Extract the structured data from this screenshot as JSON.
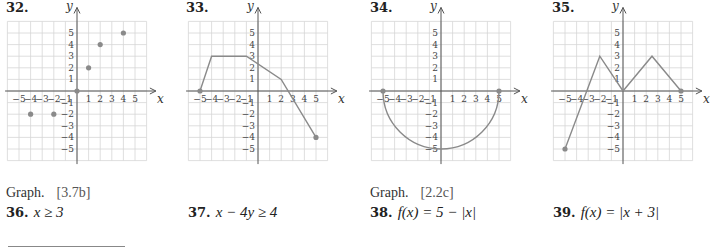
{
  "graphs": [
    {
      "number": "32.",
      "ox": 77,
      "type": "scatter",
      "points": [
        [
          -4,
          -2
        ],
        [
          -2,
          -2
        ],
        [
          0,
          0
        ],
        [
          1,
          2
        ],
        [
          2,
          4
        ],
        [
          4,
          5
        ]
      ]
    },
    {
      "number": "33.",
      "ox": 258,
      "type": "line",
      "points": [
        [
          -5,
          0
        ],
        [
          -4,
          3
        ],
        [
          -1,
          3
        ],
        [
          2,
          1
        ],
        [
          5,
          -4
        ]
      ],
      "endpoints": [
        [
          -5,
          0
        ],
        [
          5,
          -4
        ]
      ]
    },
    {
      "number": "34.",
      "ox": 441,
      "type": "semicircle",
      "radius": 5,
      "endpoints": [
        [
          -5,
          0
        ],
        [
          5,
          0
        ]
      ]
    },
    {
      "number": "35.",
      "ox": 623,
      "type": "line",
      "points": [
        [
          -5,
          -5
        ],
        [
          -2,
          3
        ],
        [
          0,
          0
        ],
        [
          2.5,
          3
        ],
        [
          5,
          0
        ]
      ],
      "endpoints": [
        [
          -5,
          -5
        ],
        [
          5,
          0
        ]
      ]
    }
  ],
  "axis": {
    "x_label": "x",
    "y_label": "y",
    "ticks": [
      -5,
      -4,
      -3,
      -2,
      -1,
      1,
      2,
      3,
      4,
      5
    ]
  },
  "sections": [
    {
      "instruction": "Graph.",
      "ref": "[3.7b]",
      "problems": [
        {
          "num": "36.",
          "expr": "x ≥ 3"
        },
        {
          "num": "37.",
          "expr": "x − 4y ≥ 4"
        }
      ]
    },
    {
      "instruction": "Graph.",
      "ref": "[2.2c]",
      "problems": [
        {
          "num": "38.",
          "expr": "f(x) = 5 − |x|"
        },
        {
          "num": "39.",
          "expr": "f(x) = |x + 3|"
        }
      ]
    }
  ],
  "chart_data": [
    {
      "type": "scatter",
      "title": "32.",
      "x": [
        -4,
        -2,
        0,
        1,
        2,
        4
      ],
      "y": [
        -2,
        -2,
        0,
        2,
        4,
        5
      ],
      "xlabel": "x",
      "ylabel": "y",
      "xlim": [
        -6,
        6
      ],
      "ylim": [
        -6,
        6
      ],
      "grid": true
    },
    {
      "type": "line",
      "title": "33.",
      "x": [
        -5,
        -4,
        -1,
        2,
        5
      ],
      "y": [
        0,
        3,
        3,
        1,
        -4
      ],
      "xlabel": "x",
      "ylabel": "y",
      "xlim": [
        -6,
        6
      ],
      "ylim": [
        -6,
        6
      ],
      "grid": true
    },
    {
      "type": "line",
      "title": "34.",
      "description": "lower semicircle radius 5 centered at origin",
      "x": [
        -5,
        -4,
        -3,
        0,
        3,
        4,
        5
      ],
      "y": [
        0,
        -3,
        -4,
        -5,
        -4,
        -3,
        0
      ],
      "xlabel": "x",
      "ylabel": "y",
      "xlim": [
        -6,
        6
      ],
      "ylim": [
        -6,
        6
      ],
      "grid": true
    },
    {
      "type": "line",
      "title": "35.",
      "x": [
        -5,
        -2,
        0,
        2.5,
        5
      ],
      "y": [
        -5,
        3,
        0,
        3,
        0
      ],
      "xlabel": "x",
      "ylabel": "y",
      "xlim": [
        -6,
        6
      ],
      "ylim": [
        -6,
        6
      ],
      "grid": true
    }
  ]
}
